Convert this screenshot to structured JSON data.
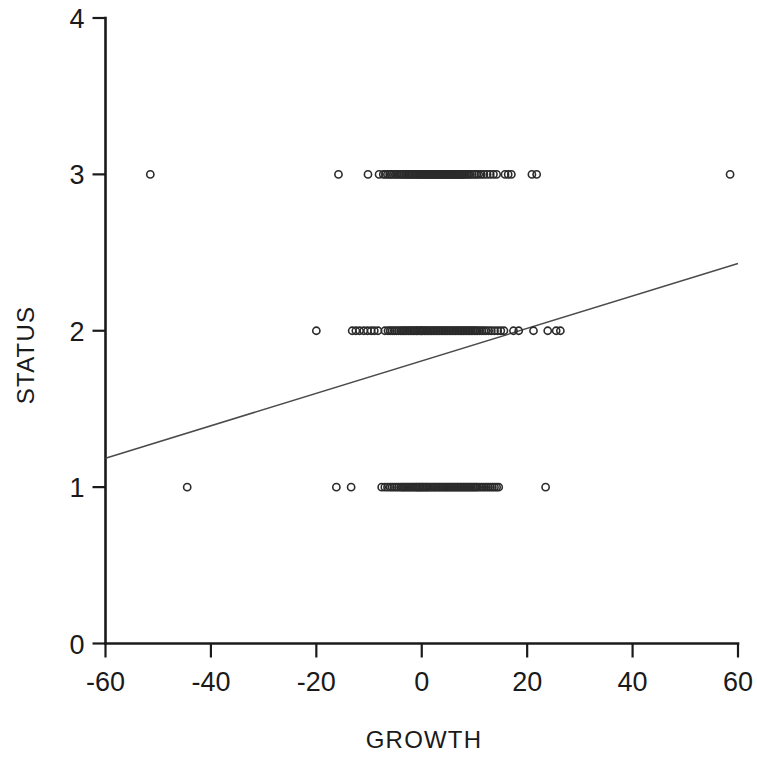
{
  "chart_data": {
    "type": "scatter",
    "title": "",
    "xlabel": "GROWTH",
    "ylabel": "STATUS",
    "xlim": [
      -60,
      60
    ],
    "ylim": [
      0,
      4
    ],
    "xticks": [
      -60,
      -40,
      -20,
      0,
      20,
      40,
      60
    ],
    "xticklabels": [
      "-60",
      "-40",
      "-20",
      "0",
      "20",
      "40",
      "60"
    ],
    "yticks": [
      0,
      1,
      2,
      3,
      4
    ],
    "yticklabels": [
      "0",
      "1",
      "2",
      "3",
      "4"
    ],
    "grid": false,
    "legend": null,
    "marker": "open-circle",
    "marker_color": "#2b2b2b",
    "line_color": "#4a4a4a",
    "series": [
      {
        "name": "STATUS = 3",
        "y": 3,
        "x": [
          -51.5,
          -15.8,
          -10.2,
          -8.1,
          -7.3,
          -6.9,
          -6.5,
          -6.1,
          -5.8,
          -5.4,
          -5.0,
          -4.7,
          -4.3,
          -4.0,
          -3.7,
          -3.4,
          -3.1,
          -2.9,
          -2.6,
          -2.3,
          -2.1,
          -1.8,
          -1.6,
          -1.3,
          -1.1,
          -0.9,
          -0.6,
          -0.4,
          -0.2,
          0.0,
          0.2,
          0.4,
          0.6,
          0.8,
          1.0,
          1.2,
          1.4,
          1.6,
          1.8,
          2.0,
          2.2,
          2.4,
          2.6,
          2.8,
          3.0,
          3.2,
          3.4,
          3.6,
          3.8,
          4.0,
          4.2,
          4.4,
          4.6,
          4.8,
          5.0,
          5.2,
          5.4,
          5.6,
          5.8,
          6.0,
          6.2,
          6.4,
          6.6,
          6.8,
          7.0,
          7.2,
          7.4,
          7.6,
          7.8,
          8.0,
          8.3,
          8.6,
          8.9,
          9.2,
          9.6,
          10.0,
          10.4,
          10.8,
          11.3,
          11.8,
          12.4,
          13.0,
          13.6,
          14.2,
          15.8,
          16.4,
          17.0,
          20.9,
          21.8,
          58.5
        ]
      },
      {
        "name": "STATUS = 2",
        "y": 2,
        "x": [
          -20.0,
          -13.2,
          -12.5,
          -11.8,
          -11.0,
          -10.3,
          -9.6,
          -9.0,
          -8.3,
          -7.0,
          -6.4,
          -6.0,
          -5.6,
          -5.2,
          -4.8,
          -4.4,
          -4.0,
          -3.7,
          -3.4,
          -3.1,
          -2.8,
          -2.5,
          -2.2,
          -1.9,
          -1.6,
          -1.3,
          -1.0,
          -0.8,
          -0.5,
          -0.2,
          0.0,
          0.2,
          0.5,
          0.8,
          1.0,
          1.3,
          1.6,
          1.9,
          2.2,
          2.5,
          2.8,
          3.1,
          3.4,
          3.7,
          4.0,
          4.3,
          4.6,
          4.9,
          5.2,
          5.5,
          5.8,
          6.1,
          6.4,
          6.7,
          7.0,
          7.3,
          7.6,
          7.9,
          8.2,
          8.5,
          8.8,
          9.1,
          9.4,
          9.7,
          10.0,
          10.3,
          10.6,
          11.0,
          11.4,
          11.8,
          12.2,
          12.7,
          13.2,
          13.8,
          14.4,
          15.0,
          15.6,
          17.4,
          18.4,
          21.2,
          23.9,
          25.5,
          26.3
        ]
      },
      {
        "name": "STATUS = 1",
        "y": 1,
        "x": [
          -44.5,
          -16.2,
          -13.4,
          -7.6,
          -7.0,
          -6.5,
          -6.0,
          -5.6,
          -5.2,
          -4.8,
          -4.4,
          -4.0,
          -3.7,
          -3.4,
          -3.1,
          -2.8,
          -2.5,
          -2.2,
          -1.9,
          -1.6,
          -1.3,
          -1.0,
          -0.8,
          -0.5,
          -0.3,
          0.0,
          0.2,
          0.5,
          0.8,
          1.0,
          1.3,
          1.6,
          1.9,
          2.2,
          2.5,
          2.8,
          3.1,
          3.4,
          3.7,
          4.0,
          4.3,
          4.6,
          4.9,
          5.2,
          5.5,
          5.8,
          6.1,
          6.4,
          6.7,
          7.0,
          7.3,
          7.6,
          7.9,
          8.2,
          8.5,
          8.8,
          9.1,
          9.4,
          9.7,
          10.0,
          10.3,
          10.6,
          11.0,
          11.4,
          11.8,
          12.2,
          12.6,
          13.0,
          13.4,
          13.8,
          14.2,
          14.6,
          23.5
        ]
      }
    ],
    "fit_line": {
      "name": "regression line",
      "x": [
        -60,
        60
      ],
      "y": [
        1.185,
        2.43
      ]
    }
  }
}
